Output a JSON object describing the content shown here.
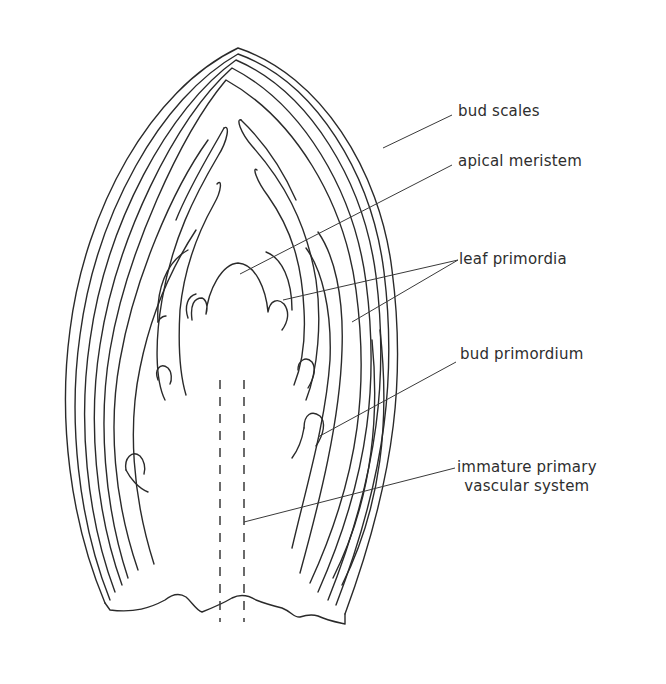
{
  "diagram": {
    "colors": {
      "background": "#ffffff",
      "stroke": "#2a2a2a",
      "text": "#2e2e2e"
    },
    "labels": [
      {
        "id": "bud-scales",
        "text": "bud scales"
      },
      {
        "id": "apical-meristem",
        "text": "apical meristem"
      },
      {
        "id": "leaf-primordia",
        "text": "leaf primordia"
      },
      {
        "id": "bud-primordium",
        "text": "bud primordium"
      },
      {
        "id": "immature-primary-vascular-system",
        "lines": [
          "immature primary",
          "vascular system"
        ]
      }
    ]
  }
}
